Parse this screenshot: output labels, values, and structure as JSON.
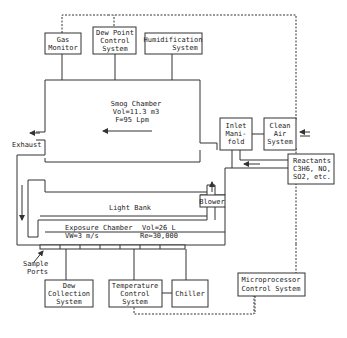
{
  "diagram": {
    "boxes": {
      "gas_monitor": [
        "Gas",
        "Monitor"
      ],
      "dew_point": [
        "Dew Point",
        "Control",
        "System"
      ],
      "humidification": [
        "Humidification",
        "System"
      ],
      "inlet_manifold": [
        "Inlet",
        "Mani-",
        "fold"
      ],
      "clean_air": [
        "Clean",
        "Air",
        "System"
      ],
      "reactants": [
        "Reactants",
        "C3H6, NO,",
        "SO2, etc."
      ],
      "blower": "Blower",
      "dew_collection": [
        "Dew",
        "Collection",
        "System"
      ],
      "temperature_control": [
        "Temperature",
        "Control",
        "System"
      ],
      "chiller": "Chiller",
      "microprocessor": [
        "Microprocessor",
        "Control System"
      ]
    },
    "smog_chamber": {
      "title": "Smog Chamber",
      "volume": "Vol=11.3 m3",
      "flow": "F=95 Lpm"
    },
    "exposure_chamber": {
      "title": "Exposure Chamber",
      "volume": "Vol=26 L",
      "velocity": "VW=3 m/s",
      "reynolds": "Re≈30,000"
    },
    "labels": {
      "exhaust": "Exhaust",
      "light_bank": "Light Bank",
      "sample_ports": [
        "Sample",
        "Ports"
      ]
    }
  }
}
